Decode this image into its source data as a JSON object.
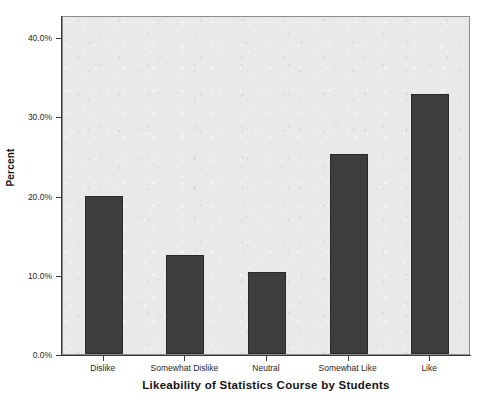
{
  "chart_data": {
    "type": "bar",
    "title": "",
    "xlabel": "Likeability of Statistics Course by Students",
    "ylabel": "Percent",
    "categories": [
      "Dislike",
      "Somewhat Dislike",
      "Neutral",
      "Somewhat Like",
      "Like"
    ],
    "values": [
      20.0,
      12.5,
      10.3,
      25.2,
      32.8
    ],
    "value_labels": [
      "20.0%",
      "12.5%",
      "10.3%",
      "25.2%",
      "32.8%"
    ],
    "ylim": [
      0,
      42.8
    ],
    "ytick_values": [
      0.0,
      10.0,
      20.0,
      30.0,
      40.0
    ],
    "ytick_labels": [
      "0.0%",
      "10.0%",
      "20.0%",
      "30.0%",
      "40.0%"
    ],
    "grid": false,
    "legend": null,
    "legend_position": "none",
    "bar_color": "#3e3c3c",
    "plot_background": "#e9e9e9",
    "axis_color": "#3a3a3a"
  }
}
